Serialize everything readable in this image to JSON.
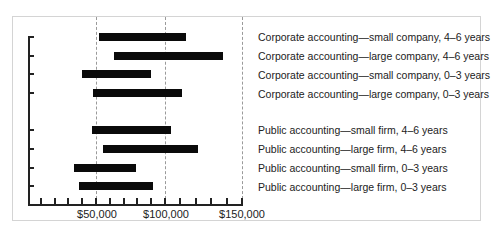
{
  "chart_data": {
    "type": "bar",
    "orientation": "horizontal-range",
    "title": "",
    "xlabel": "",
    "ylabel": "",
    "xlim": [
      0,
      150000
    ],
    "x_ticks": [
      "$50,000",
      "$100,000",
      "$150,000"
    ],
    "grid": "vertical dashed at $50,000, $100,000, $150,000",
    "categories": [
      "Corporate accounting—small company, 4–6 years",
      "Corporate accounting—large company, 4–6 years",
      "Corporate accounting—small company, 0–3 years",
      "Corporate accounting—large company, 0–3 years",
      "Public accounting—small firm, 4–6 years",
      "Public accounting—large firm, 4–6 years",
      "Public accounting—small firm, 0–3 years",
      "Public accounting—large firm, 0–3 years"
    ],
    "series": [
      {
        "name": "low",
        "values": [
          52000,
          63000,
          40000,
          48000,
          47000,
          55000,
          34000,
          38000
        ]
      },
      {
        "name": "high",
        "values": [
          115000,
          142000,
          90000,
          112000,
          104000,
          124000,
          79000,
          91000
        ]
      }
    ]
  },
  "labels": {
    "x50": "$50,000",
    "x100": "$100,000",
    "x150": "$150,000",
    "r0": "Corporate accounting—small company, 4–6 years",
    "r1": "Corporate accounting—large company, 4–6 years",
    "r2": "Corporate accounting—small company, 0–3 years",
    "r3": "Corporate accounting—large company, 0–3 years",
    "r4": "Public accounting—small firm, 4–6 years",
    "r5": "Public accounting—large firm, 4–6 years",
    "r6": "Public accounting—small firm, 0–3 years",
    "r7": "Public accounting—large firm, 0–3 years"
  }
}
